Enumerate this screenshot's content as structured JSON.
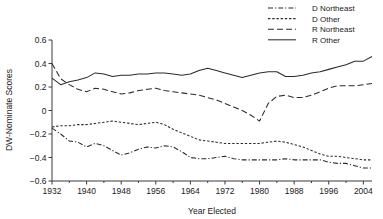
{
  "chart_data": {
    "type": "line",
    "title": "",
    "xlabel": "Year Elected",
    "ylabel": "DW-Nominate Scores",
    "xlim": [
      1932,
      2006
    ],
    "ylim": [
      -0.6,
      0.6
    ],
    "grid": false,
    "legend_position": "top-right",
    "xticks": [
      1932,
      1940,
      1948,
      1956,
      1964,
      1972,
      1980,
      1988,
      1996,
      2004
    ],
    "xticklabels": [
      "1932",
      "1940",
      "1948",
      "1956",
      "1964",
      "1972",
      "1980",
      "1988",
      "1996",
      "2004"
    ],
    "xminorticks": [
      1936,
      1944,
      1952,
      1960,
      1968,
      1976,
      1984,
      1992,
      2000
    ],
    "yticks": [
      -0.6,
      -0.4,
      -0.2,
      0,
      0.2,
      0.4,
      0.6
    ],
    "yticklabels": [
      "−0.6",
      "−0.4",
      "−0.2",
      "0",
      "0.2",
      "0.4",
      "0.6"
    ],
    "x": [
      1932,
      1934,
      1936,
      1938,
      1940,
      1942,
      1944,
      1946,
      1948,
      1950,
      1952,
      1954,
      1956,
      1958,
      1960,
      1962,
      1964,
      1966,
      1968,
      1970,
      1972,
      1974,
      1976,
      1978,
      1980,
      1982,
      1984,
      1986,
      1988,
      1990,
      1992,
      1994,
      1996,
      1998,
      2000,
      2002,
      2004,
      2006
    ],
    "series": [
      {
        "name": "D Northeast",
        "dash": "dash-dot",
        "values": [
          -0.15,
          -0.2,
          -0.26,
          -0.27,
          -0.31,
          -0.28,
          -0.3,
          -0.34,
          -0.38,
          -0.36,
          -0.33,
          -0.31,
          -0.32,
          -0.3,
          -0.31,
          -0.35,
          -0.4,
          -0.41,
          -0.41,
          -0.4,
          -0.39,
          -0.41,
          -0.42,
          -0.42,
          -0.42,
          -0.42,
          -0.42,
          -0.41,
          -0.42,
          -0.42,
          -0.42,
          -0.42,
          -0.44,
          -0.45,
          -0.45,
          -0.47,
          -0.49,
          -0.49
        ]
      },
      {
        "name": "D Other",
        "dash": "fine-dash",
        "values": [
          -0.14,
          -0.13,
          -0.13,
          -0.12,
          -0.12,
          -0.11,
          -0.1,
          -0.09,
          -0.1,
          -0.11,
          -0.12,
          -0.11,
          -0.1,
          -0.12,
          -0.16,
          -0.19,
          -0.22,
          -0.25,
          -0.26,
          -0.27,
          -0.28,
          -0.28,
          -0.28,
          -0.28,
          -0.28,
          -0.27,
          -0.26,
          -0.27,
          -0.29,
          -0.31,
          -0.34,
          -0.37,
          -0.39,
          -0.39,
          -0.4,
          -0.41,
          -0.42,
          -0.42
        ]
      },
      {
        "name": "R Northeast",
        "dash": "long-dash",
        "values": [
          0.4,
          0.27,
          0.22,
          0.18,
          0.16,
          0.19,
          0.18,
          0.16,
          0.14,
          0.15,
          0.17,
          0.18,
          0.19,
          0.17,
          0.16,
          0.15,
          0.14,
          0.13,
          0.11,
          0.09,
          0.06,
          0.03,
          0.0,
          -0.04,
          -0.09,
          0.06,
          0.12,
          0.13,
          0.11,
          0.11,
          0.13,
          0.16,
          0.19,
          0.21,
          0.21,
          0.21,
          0.22,
          0.23
        ]
      },
      {
        "name": "R Other",
        "dash": "solid",
        "values": [
          0.275,
          0.22,
          0.245,
          0.26,
          0.28,
          0.32,
          0.31,
          0.29,
          0.3,
          0.3,
          0.31,
          0.31,
          0.32,
          0.32,
          0.31,
          0.3,
          0.31,
          0.34,
          0.36,
          0.34,
          0.32,
          0.3,
          0.28,
          0.3,
          0.32,
          0.33,
          0.33,
          0.29,
          0.29,
          0.3,
          0.32,
          0.33,
          0.35,
          0.37,
          0.39,
          0.42,
          0.42,
          0.46
        ]
      }
    ]
  },
  "legend": {
    "items": [
      {
        "label": "D Northeast"
      },
      {
        "label": "D Other"
      },
      {
        "label": "R Northeast"
      },
      {
        "label": "R Other"
      }
    ]
  }
}
